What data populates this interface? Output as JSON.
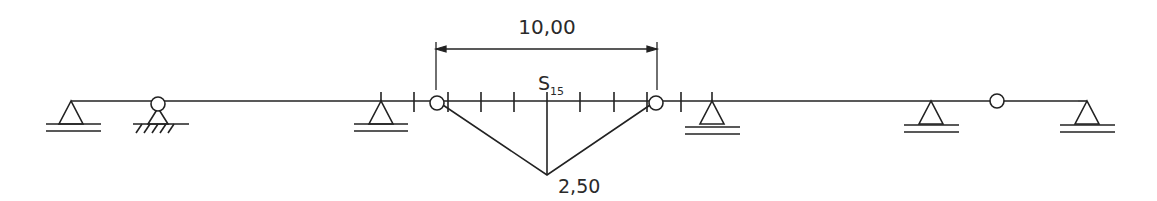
{
  "diagram": {
    "type": "influence-line",
    "dimension_label": "10,00",
    "section_label": "S",
    "section_subscript": "15",
    "ordinate_label": "2,50",
    "colors": {
      "line": "#222222",
      "background": "#ffffff"
    }
  }
}
